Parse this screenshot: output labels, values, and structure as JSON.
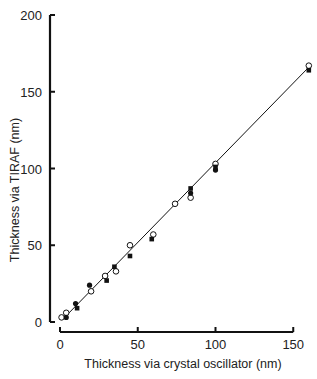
{
  "chart_data": {
    "type": "scatter",
    "title": "",
    "xlabel": "Thickness via crystal oscillator (nm)",
    "ylabel": "Thickness via TIRAF (nm)",
    "xlim": [
      0,
      160
    ],
    "ylim": [
      0,
      200
    ],
    "x_ticks": [
      "0",
      "50",
      "100",
      "150"
    ],
    "y_ticks": [
      "0",
      "50",
      "100",
      "150",
      "200"
    ],
    "grid": false,
    "legend": null,
    "series": [
      {
        "name": "open circles",
        "marker": "open-circle",
        "points": [
          [
            1,
            3
          ],
          [
            4,
            6
          ],
          [
            20,
            20
          ],
          [
            29,
            30
          ],
          [
            36,
            33
          ],
          [
            45,
            50
          ],
          [
            60,
            57
          ],
          [
            74,
            77
          ],
          [
            84,
            81
          ],
          [
            100,
            103
          ],
          [
            160,
            167
          ]
        ]
      },
      {
        "name": "filled circles",
        "marker": "filled-circle",
        "points": [
          [
            4,
            3
          ],
          [
            10,
            12
          ],
          [
            19,
            24
          ],
          [
            84,
            84
          ],
          [
            100,
            99
          ]
        ]
      },
      {
        "name": "filled squares",
        "marker": "filled-square",
        "points": [
          [
            11,
            9
          ],
          [
            30,
            27
          ],
          [
            35,
            36
          ],
          [
            45,
            43
          ],
          [
            59,
            54
          ],
          [
            84,
            87
          ],
          [
            100,
            101
          ],
          [
            160,
            164
          ]
        ]
      }
    ],
    "fit_line": {
      "x": [
        2,
        160
      ],
      "y": [
        2,
        166
      ]
    }
  },
  "axes": {
    "x_label": "Thickness via crystal oscillator (nm)",
    "y_label": "Thickness via TIRAF (nm)"
  },
  "colors": {
    "ink": "#111111",
    "background": "#ffffff"
  }
}
